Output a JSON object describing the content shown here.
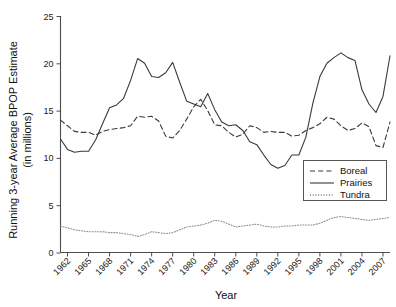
{
  "chart_data": {
    "type": "line",
    "title": "",
    "xlabel": "Year",
    "ylabel": "Running 3-year Average BPOP Estimate (in millions)",
    "ylabel_line1": "Running 3-year Average BPOP Estimate",
    "ylabel_line2": "(in millions)",
    "xlim": [
      1961,
      2008
    ],
    "ylim": [
      0,
      25
    ],
    "yticks": [
      0,
      5,
      10,
      15,
      20,
      25
    ],
    "ytick_labels": [
      "0",
      "5",
      "10",
      "15",
      "20",
      "25"
    ],
    "xticks": [
      1962,
      1965,
      1968,
      1971,
      1974,
      1977,
      1980,
      1983,
      1986,
      1989,
      1992,
      1995,
      1998,
      2001,
      2004,
      2007
    ],
    "xtick_labels": [
      "1962",
      "1965",
      "1968",
      "1971",
      "1974",
      "1977",
      "1980",
      "1983",
      "1986",
      "1989",
      "1992",
      "1995",
      "1998",
      "2001",
      "2004",
      "2007"
    ],
    "grid": false,
    "legend_position": "lower right",
    "x": [
      1961,
      1962,
      1963,
      1964,
      1965,
      1966,
      1967,
      1968,
      1969,
      1970,
      1971,
      1972,
      1973,
      1974,
      1975,
      1976,
      1977,
      1978,
      1979,
      1980,
      1981,
      1982,
      1983,
      1984,
      1985,
      1986,
      1987,
      1988,
      1989,
      1990,
      1991,
      1992,
      1993,
      1994,
      1995,
      1996,
      1997,
      1998,
      1999,
      2000,
      2001,
      2002,
      2003,
      2004,
      2005,
      2006,
      2007,
      2008
    ],
    "series": [
      {
        "name": "Boreal",
        "style": "dashed",
        "color": "#3a3a3a",
        "values": [
          14.0,
          13.4,
          12.8,
          12.7,
          12.7,
          12.4,
          12.8,
          13.0,
          13.1,
          13.2,
          13.4,
          14.4,
          14.3,
          14.4,
          13.9,
          12.3,
          12.1,
          12.9,
          14.1,
          15.4,
          16.2,
          15.0,
          13.5,
          13.4,
          12.7,
          12.2,
          12.5,
          13.4,
          13.2,
          12.7,
          12.8,
          12.7,
          12.7,
          12.3,
          12.4,
          12.9,
          13.2,
          13.6,
          14.3,
          14.1,
          13.4,
          12.9,
          13.1,
          13.7,
          13.3,
          11.3,
          11.1,
          13.8
        ]
      },
      {
        "name": "Prairies",
        "style": "solid",
        "color": "#3a3a3a",
        "values": [
          12.0,
          10.9,
          10.6,
          10.7,
          10.7,
          11.9,
          13.6,
          15.3,
          15.6,
          16.3,
          18.2,
          20.5,
          20.0,
          18.6,
          18.5,
          19.0,
          20.1,
          18.0,
          16.0,
          15.7,
          15.4,
          16.8,
          15.1,
          13.8,
          13.4,
          13.5,
          12.9,
          11.7,
          11.4,
          10.3,
          9.3,
          8.9,
          9.2,
          10.3,
          10.3,
          12.2,
          15.8,
          18.6,
          20.0,
          20.6,
          21.1,
          20.6,
          20.3,
          17.2,
          15.7,
          14.8,
          16.5,
          20.8
        ]
      },
      {
        "name": "Tundra",
        "style": "dotted",
        "color": "#8f8f8f",
        "values": [
          2.8,
          2.6,
          2.4,
          2.3,
          2.2,
          2.2,
          2.2,
          2.1,
          2.1,
          2.0,
          1.9,
          1.7,
          1.9,
          2.2,
          2.1,
          2.0,
          2.1,
          2.4,
          2.7,
          2.8,
          2.9,
          3.1,
          3.4,
          3.3,
          3.0,
          2.7,
          2.8,
          2.9,
          3.0,
          2.8,
          2.7,
          2.7,
          2.8,
          2.8,
          2.9,
          2.9,
          2.9,
          3.1,
          3.4,
          3.7,
          3.8,
          3.7,
          3.6,
          3.5,
          3.4,
          3.5,
          3.6,
          3.7
        ]
      }
    ]
  },
  "legend": {
    "items": [
      {
        "label": "Boreal",
        "style": "dashed"
      },
      {
        "label": "Prairies",
        "style": "solid"
      },
      {
        "label": "Tundra",
        "style": "dotted"
      }
    ]
  }
}
